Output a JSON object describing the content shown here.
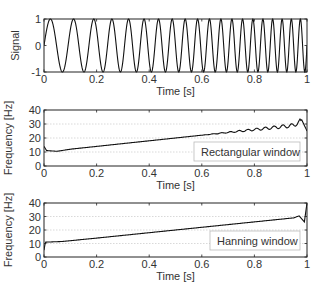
{
  "chart_data": [
    {
      "type": "line",
      "title": "",
      "xlabel": "Time [s]",
      "ylabel": "Signal",
      "xlim": [
        0,
        1
      ],
      "ylim": [
        -1,
        1
      ],
      "xticks": [
        "0",
        "0.2",
        "0.4",
        "0.6",
        "0.8",
        "1"
      ],
      "yticks": [
        "-1",
        "0",
        "1"
      ],
      "grid": false,
      "legend": null,
      "series": [
        {
          "name": "chirp signal",
          "description": "sin chirp, frequency linearly increasing ~10 Hz to ~30 Hz",
          "f0": 10,
          "f1": 30,
          "amplitude": 1
        }
      ]
    },
    {
      "type": "line",
      "title": "",
      "xlabel": "Time [s]",
      "ylabel": "Frequency [Hz]",
      "xlim": [
        0,
        1
      ],
      "ylim": [
        0,
        40
      ],
      "xticks": [
        "0",
        "0.2",
        "0.4",
        "0.6",
        "0.8",
        "1"
      ],
      "yticks": [
        "0",
        "10",
        "20",
        "30",
        "40"
      ],
      "grid": "y dotted at 10, 20, 30",
      "legend": {
        "entries": [
          "Rectangular window"
        ],
        "position": "lower right"
      },
      "series": [
        {
          "name": "Rectangular window",
          "x": [
            0,
            0.01,
            0.05,
            0.1,
            0.2,
            0.3,
            0.4,
            0.5,
            0.6,
            0.7,
            0.8,
            0.85,
            0.9,
            0.95,
            0.98,
            1.0
          ],
          "y": [
            14,
            11,
            10.5,
            12,
            14,
            16,
            18,
            20,
            22,
            24,
            26,
            27,
            28,
            29,
            33,
            25
          ]
        }
      ]
    },
    {
      "type": "line",
      "title": "",
      "xlabel": "Time [s]",
      "ylabel": "Frequency [Hz]",
      "xlim": [
        0,
        1
      ],
      "ylim": [
        0,
        40
      ],
      "xticks": [
        "0",
        "0.2",
        "0.4",
        "0.6",
        "0.8",
        "1"
      ],
      "yticks": [
        "0",
        "10",
        "20",
        "30",
        "40"
      ],
      "grid": "y dotted at 10, 20, 30",
      "legend": {
        "entries": [
          "Hanning window"
        ],
        "position": "lower right"
      },
      "series": [
        {
          "name": "Hanning window",
          "x": [
            0,
            0.005,
            0.07,
            0.2,
            0.4,
            0.6,
            0.8,
            0.95,
            0.97,
            0.99,
            1.0
          ],
          "y": [
            5,
            11,
            11.5,
            14,
            18,
            22,
            26,
            29,
            30.5,
            26,
            40
          ]
        }
      ]
    }
  ],
  "labels": {
    "signal_ylabel": "Signal",
    "freq_ylabel": "Frequency [Hz]",
    "xlabel": "Time [s]",
    "legend_rect": "Rectangular window",
    "legend_hann": "Hanning window"
  }
}
